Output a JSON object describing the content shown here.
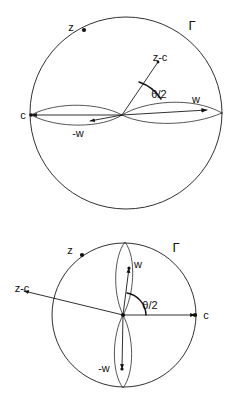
{
  "figure": {
    "title": "",
    "background_color": "#ffffff",
    "stroke_color": "#101010",
    "panels": [
      {
        "id": "top-panel",
        "name": "horizontal-configuration",
        "circle": {
          "cx": 126,
          "cy": 113,
          "r": 96
        },
        "center_point": {
          "x": 122,
          "y": 115
        },
        "labels": {
          "circle_boundary": "Γ",
          "point_z": "z",
          "vector_z_minus_c": "z-c",
          "angle": "θ/2",
          "vector_w": "w",
          "vector_minus_w": "-w",
          "point_c": "c"
        },
        "label_positions": {
          "circle_boundary": {
            "x": 192,
            "y": 27
          },
          "point_z": {
            "x": 71,
            "y": 28
          },
          "vector_z_minus_c": {
            "x": 160,
            "y": 58
          },
          "angle": {
            "x": 159,
            "y": 95
          },
          "vector_w": {
            "x": 196,
            "y": 100
          },
          "vector_minus_w": {
            "x": 78,
            "y": 134
          },
          "point_c": {
            "x": 23,
            "y": 116
          }
        }
      },
      {
        "id": "bottom-panel",
        "name": "vertical-configuration",
        "circle": {
          "cx": 124,
          "cy": 315,
          "r": 72
        },
        "center_point": {
          "x": 123,
          "y": 315
        },
        "labels": {
          "circle_boundary": "Γ",
          "point_z": "z",
          "vector_z_minus_c": "z-c",
          "angle": "θ/2",
          "vector_w": "w",
          "vector_minus_w": "-w",
          "point_c": "c"
        },
        "label_positions": {
          "circle_boundary": {
            "x": 176,
            "y": 249
          },
          "point_z": {
            "x": 70,
            "y": 251
          },
          "vector_z_minus_c": {
            "x": 22,
            "y": 289
          },
          "angle": {
            "x": 150,
            "y": 306
          },
          "vector_w": {
            "x": 138,
            "y": 265
          },
          "vector_minus_w": {
            "x": 104,
            "y": 369
          },
          "point_c": {
            "x": 206,
            "y": 316
          }
        }
      }
    ]
  }
}
